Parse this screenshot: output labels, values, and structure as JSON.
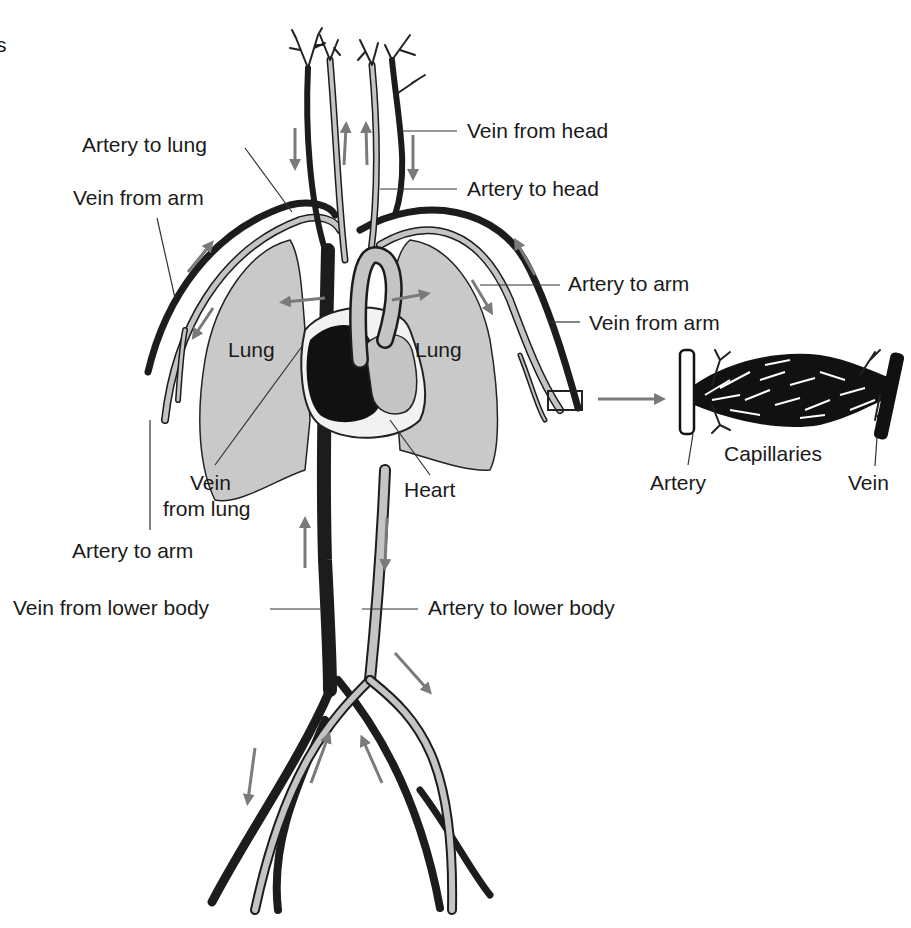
{
  "diagram": {
    "title_fragment": "s",
    "labels": {
      "artery_to_lung": "Artery to lung",
      "vein_from_arm_left": "Vein from arm",
      "vein_from_head": "Vein from head",
      "artery_to_head": "Artery to head",
      "artery_to_arm_right": "Artery to arm",
      "vein_from_arm_right": "Vein from arm",
      "lung_left": "Lung",
      "lung_right": "Lung",
      "vein_from_lung_1": "Vein",
      "vein_from_lung_2": "from lung",
      "heart": "Heart",
      "artery_to_arm_left": "Artery to arm",
      "vein_from_lower_body": "Vein from lower body",
      "artery_to_lower_body": "Artery to lower body",
      "capillaries": "Capillaries",
      "artery_detail": "Artery",
      "vein_detail": "Vein"
    },
    "colors": {
      "vein": "#1c1c1c",
      "artery_fill": "#c4c4c4",
      "lung_fill": "#c9c9c9",
      "arrow": "#7a7a7a",
      "background": "#ffffff"
    }
  }
}
